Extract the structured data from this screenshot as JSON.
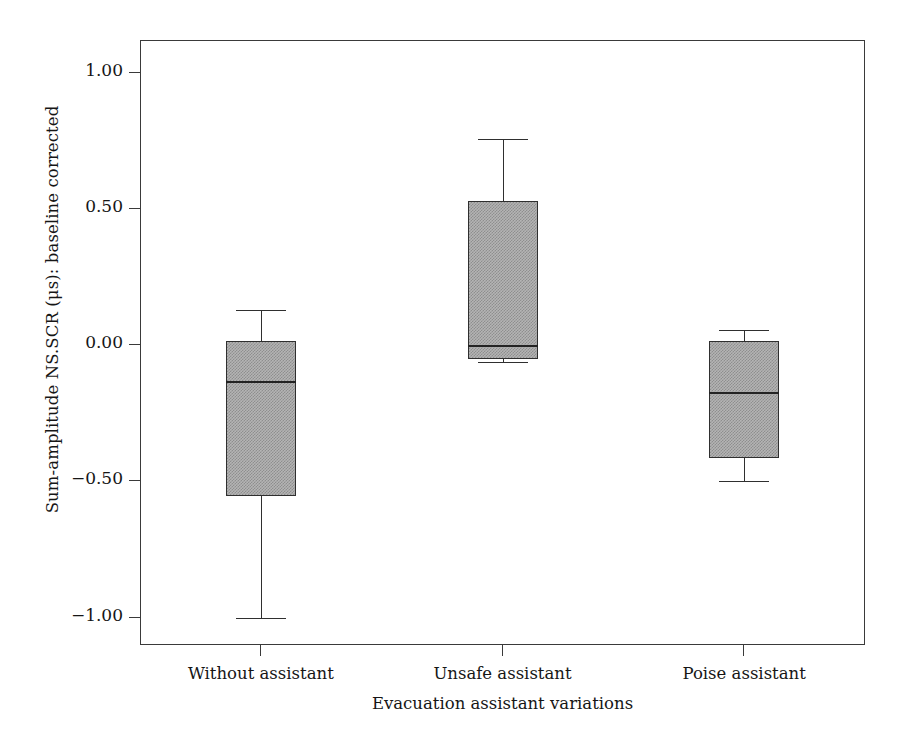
{
  "chart_data": {
    "type": "box",
    "title": "",
    "xlabel": "Evacuation assistant variations",
    "ylabel": "Sum-amplitude NS.SCR (μs): baseline corrected",
    "categories": [
      "Without assistant",
      "Unsafe assistant",
      "Poise assistant"
    ],
    "ylim": [
      -1.1,
      1.12
    ],
    "ytick_values": [
      1.0,
      0.5,
      0.0,
      -0.5,
      -1.0
    ],
    "ytick_labels": [
      "1.00",
      "0.50",
      "0.00",
      "−0.50",
      "−1.00"
    ],
    "grid": false,
    "legend": false,
    "boxes": [
      {
        "category": "Without assistant",
        "whisker_low": -1.0,
        "q1": -0.555,
        "median": -0.13,
        "q3": 0.015,
        "whisker_high": 0.13
      },
      {
        "category": "Unsafe assistant",
        "whisker_low": -0.06,
        "q1": -0.05,
        "median": 0.0,
        "q3": 0.53,
        "whisker_high": 0.755
      },
      {
        "category": "Poise assistant",
        "whisker_low": -0.5,
        "q1": -0.415,
        "median": -0.17,
        "q3": 0.015,
        "whisker_high": 0.055
      }
    ],
    "colors": {
      "box_fill": "#b4b4b4",
      "box_edge": "#2f2f2f",
      "axis": "#3a3a3a",
      "text": "#161616",
      "background": "#ffffff"
    }
  }
}
